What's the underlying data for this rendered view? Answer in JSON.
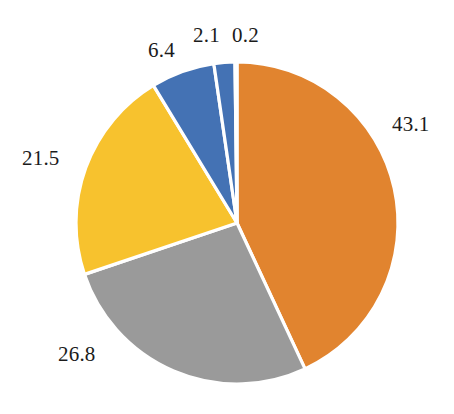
{
  "chart_data": {
    "type": "pie",
    "title": "",
    "subtitle": "",
    "xlabel": "",
    "ylabel": "",
    "grid": false,
    "legend_position": "none",
    "start_angle_deg": 0,
    "direction": "clockwise",
    "background_color": "#ffffff",
    "separator_color": "#ffffff",
    "label_color": "#1b1b1b",
    "categories": [
      "43.1",
      "26.8",
      "21.5",
      "6.4",
      "2.1",
      "0.2"
    ],
    "values": [
      43.1,
      26.8,
      21.5,
      6.4,
      2.1,
      0.2
    ],
    "colors": [
      "#e1842f",
      "#9a9a9a",
      "#f7c22e",
      "#4472b4",
      "#4472b4",
      "#3d7a33"
    ],
    "slices": [
      {
        "label": "43.1",
        "value": 43.1,
        "color": "#e1842f",
        "label_left": 392,
        "label_top": 114
      },
      {
        "label": "26.8",
        "value": 26.8,
        "color": "#9a9a9a",
        "label_left": 58,
        "label_top": 344
      },
      {
        "label": "21.5",
        "value": 21.5,
        "color": "#f7c22e",
        "label_left": 22,
        "label_top": 148
      },
      {
        "label": "6.4",
        "value": 6.4,
        "color": "#4472b4",
        "label_left": 148,
        "label_top": 40
      },
      {
        "label": "2.1",
        "value": 2.1,
        "color": "#4472b4",
        "label_left": 193,
        "label_top": 25
      },
      {
        "label": "0.2",
        "value": 0.2,
        "color": "#3d7a33",
        "label_left": 232,
        "label_top": 25
      }
    ],
    "geometry": {
      "center_x": 237,
      "center_y": 223,
      "radius": 161
    }
  }
}
